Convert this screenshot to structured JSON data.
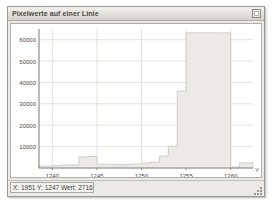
{
  "window": {
    "title": "Pixelwerte auf einer Linie",
    "title_button": "maximize-restore-icon"
  },
  "statusbar": {
    "x_label": "X:",
    "x_value": "1951",
    "y_label": "Y:",
    "y_value": "1247",
    "value_label": "Wert:",
    "value_value": "2716",
    "text": "X: 1951  Y: 1247  Wert: 2716",
    "resize_grip": "resize-grip-icon"
  },
  "colors": {
    "window_face": "#eceae6",
    "plot_background": "#ffffff",
    "grid": "#e4e3df",
    "axis": "#8f8d88",
    "series_fill": "#ebeae6",
    "series_stroke": "#c9c7c2",
    "text": "#4a4a46"
  },
  "chart_data": {
    "type": "area",
    "title": "Pixelwerte auf einer Linie",
    "xlabel": "",
    "ylabel": "",
    "axis_caption_right": "Y",
    "grid": true,
    "legend": "none",
    "xlim": [
      1238.5,
      1262.5
    ],
    "ylim": [
      0,
      65000
    ],
    "xticks": [
      1240,
      1245,
      1250,
      1255,
      1260
    ],
    "yticks": [
      10000,
      20000,
      30000,
      40000,
      50000,
      60000
    ],
    "ytick_labels": [
      "10000",
      "20000",
      "30000",
      "40000",
      "50000",
      "60000"
    ],
    "xtick_labels": [
      "1240",
      "1245",
      "1250",
      "1255",
      "1260"
    ],
    "x": [
      1238.5,
      1239,
      1240,
      1241,
      1242,
      1243,
      1244,
      1245,
      1246,
      1247,
      1248,
      1249,
      1250,
      1251,
      1252,
      1253,
      1254,
      1255,
      1259,
      1260,
      1261,
      1262,
      1262.5
    ],
    "values": [
      900,
      900,
      1100,
      1400,
      1500,
      5200,
      5400,
      1800,
      1700,
      1600,
      1700,
      1900,
      2300,
      2700,
      5600,
      10200,
      36000,
      63200,
      63200,
      500,
      2400,
      2400,
      600
    ],
    "series": [
      {
        "name": "Pixelwert",
        "values": [
          900,
          900,
          1100,
          1400,
          1500,
          5200,
          5400,
          1800,
          1700,
          1600,
          1700,
          1900,
          2300,
          2700,
          5600,
          10200,
          36000,
          63200,
          63200,
          500,
          2400,
          2400,
          600
        ]
      }
    ]
  }
}
